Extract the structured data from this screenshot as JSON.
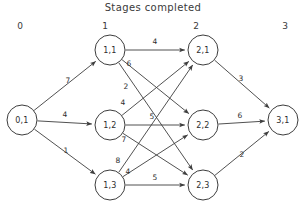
{
  "title": "Stages  completed",
  "stage_axis": {
    "labels": [
      "0",
      "1",
      "2",
      "3"
    ]
  },
  "nodes": [
    {
      "id": "n01",
      "label": "0,1",
      "cx": 22,
      "cy": 120,
      "r": 15
    },
    {
      "id": "n11",
      "label": "1,1",
      "cx": 110,
      "cy": 50,
      "r": 15
    },
    {
      "id": "n12",
      "label": "1,2",
      "cx": 110,
      "cy": 125,
      "r": 15
    },
    {
      "id": "n13",
      "label": "1,3",
      "cx": 110,
      "cy": 185,
      "r": 15
    },
    {
      "id": "n21",
      "label": "2,1",
      "cx": 203,
      "cy": 50,
      "r": 15
    },
    {
      "id": "n22",
      "label": "2,2",
      "cx": 203,
      "cy": 125,
      "r": 15
    },
    {
      "id": "n23",
      "label": "2,3",
      "cx": 203,
      "cy": 185,
      "r": 15
    },
    {
      "id": "n31",
      "label": "3,1",
      "cx": 283,
      "cy": 120,
      "r": 15
    }
  ],
  "edges": [
    {
      "from": "n01",
      "to": "n11",
      "weight": "7",
      "lx": 68,
      "ly": 83
    },
    {
      "from": "n01",
      "to": "n12",
      "weight": "4",
      "lx": 65,
      "ly": 117
    },
    {
      "from": "n01",
      "to": "n13",
      "weight": "1",
      "lx": 66,
      "ly": 153
    },
    {
      "from": "n11",
      "to": "n21",
      "weight": "4",
      "lx": 155,
      "ly": 44
    },
    {
      "from": "n11",
      "to": "n22",
      "weight": "6",
      "lx": 129,
      "ly": 66
    },
    {
      "from": "n11",
      "to": "n23",
      "weight": "2",
      "lx": 126,
      "ly": 89
    },
    {
      "from": "n12",
      "to": "n21",
      "weight": "4",
      "lx": 123,
      "ly": 105
    },
    {
      "from": "n12",
      "to": "n22",
      "weight": "5",
      "lx": 152,
      "ly": 119
    },
    {
      "from": "n12",
      "to": "n23",
      "weight": "7",
      "lx": 124,
      "ly": 142
    },
    {
      "from": "n13",
      "to": "n21",
      "weight": "8",
      "lx": 118,
      "ly": 163
    },
    {
      "from": "n13",
      "to": "n22",
      "weight": "4",
      "lx": 128,
      "ly": 174
    },
    {
      "from": "n13",
      "to": "n23",
      "weight": "5",
      "lx": 155,
      "ly": 180
    },
    {
      "from": "n21",
      "to": "n31",
      "weight": "3",
      "lx": 241,
      "ly": 81
    },
    {
      "from": "n22",
      "to": "n31",
      "weight": "6",
      "lx": 240,
      "ly": 118
    },
    {
      "from": "n23",
      "to": "n31",
      "weight": "2",
      "lx": 242,
      "ly": 157
    }
  ],
  "colors": {
    "ink": "#3d3d3d",
    "background": "#ffffff"
  }
}
